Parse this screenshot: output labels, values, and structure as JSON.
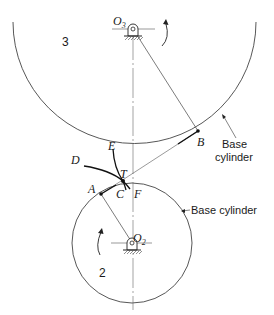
{
  "figure": {
    "gear_3": {
      "number_label": "3",
      "center_label": "O",
      "center_subscript": "3",
      "base_cylinder_label_line1": "Base",
      "base_cylinder_label_line2": "cylinder"
    },
    "gear_2": {
      "number_label": "2",
      "center_label": "O",
      "center_subscript": "2",
      "base_cylinder_label": "Base cylinder"
    },
    "points": {
      "A": "A",
      "B": "B",
      "C": "C",
      "D": "D",
      "E": "E",
      "F": "F",
      "T": "T"
    }
  }
}
